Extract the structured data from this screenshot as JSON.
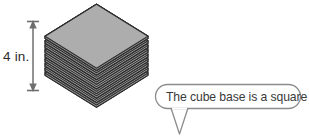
{
  "figure": {
    "background_color": "#ffffff"
  },
  "dimension": {
    "label": "4 in.",
    "arrow_color": "#6f6f6f",
    "orientation": "vertical",
    "value": 4,
    "unit": "in."
  },
  "stack": {
    "name": "paper-stack",
    "sheet_count": 17,
    "top_face_fill": "#a8a8a8",
    "sheet_fill": "#9a9a9a",
    "edge_color": "#2e2e2e",
    "shape_description": "square sheets in oblique view"
  },
  "callout": {
    "text": "The cube base is a square.",
    "border_color": "#8c8c8c",
    "fill_color": "#ffffff",
    "tail_direction": "down"
  }
}
